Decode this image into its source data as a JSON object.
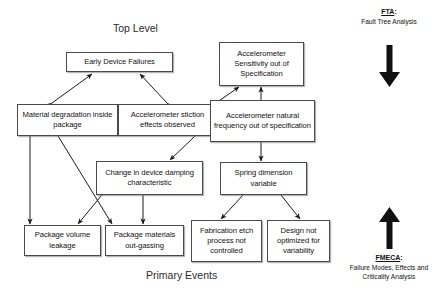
{
  "diagram": {
    "title_top": "Top Level",
    "title_bottom": "Primary Events",
    "nodes": [
      {
        "id": "early-device-failures",
        "label": "Early Device Failures"
      },
      {
        "id": "accel-sensitivity",
        "label": "Accelerometer Sensitivity out of Specification"
      },
      {
        "id": "material-degradation",
        "label": "Material degradation inside package"
      },
      {
        "id": "accel-stiction",
        "label": "Accelerometer stiction effects observed"
      },
      {
        "id": "accel-natural-frequency",
        "label": "Accelerometer natural frequency out of specification"
      },
      {
        "id": "damping-change",
        "label": "Change in device damping characteristic"
      },
      {
        "id": "spring-dimension",
        "label": "Spring dimension variable"
      },
      {
        "id": "package-volume-leakage",
        "label": "Package volume leakage"
      },
      {
        "id": "package-outgassing",
        "label": "Package materials out-gassing"
      },
      {
        "id": "fabrication-etch",
        "label": "Fabrication etch process not controlled"
      },
      {
        "id": "design-not-optimized",
        "label": "Design not optimized for variability"
      }
    ],
    "side_notes": {
      "fta": {
        "abbrev": "FTA",
        "colon": ":",
        "expansion": "Fault Tree Analysis",
        "direction": "down-arrow-icon"
      },
      "fmeca": {
        "abbrev": "FMECA",
        "colon": ":",
        "expansion_line1": "Failure Modes, Effects",
        "expansion_line2": "and Criticality Analysis",
        "direction": "up-arrow-icon"
      }
    },
    "colors": {
      "box_border": "#4a4a4a",
      "line": "#1a1a1a",
      "text": "#111111",
      "background": "#ffffff"
    }
  }
}
